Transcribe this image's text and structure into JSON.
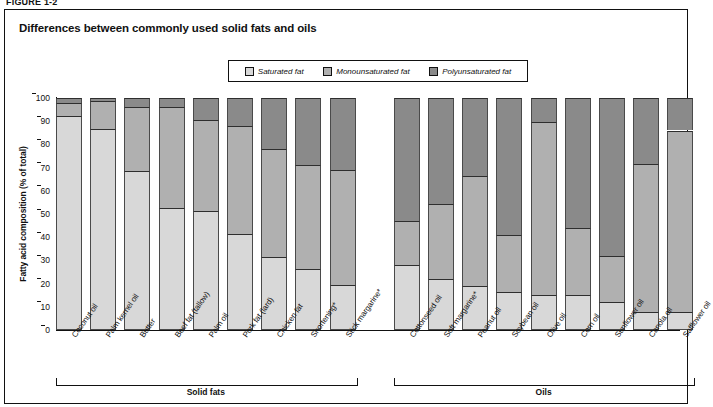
{
  "figure_number": "FIGURE 1-2",
  "chart_title": "Differences between commonly used solid fats and oils",
  "legend": {
    "items": [
      {
        "label": "Saturated fat",
        "color": "#d8d8d8",
        "key": "saturated"
      },
      {
        "label": "Monounsaturated fat",
        "color": "#b0b0b0",
        "key": "monounsaturated"
      },
      {
        "label": "Polyunsaturated fat",
        "color": "#8a8a8a",
        "key": "polyunsaturated"
      }
    ]
  },
  "axes": {
    "ylabel": "Fatty acid composition (% of total)",
    "yticks": [
      "0",
      "10",
      "20",
      "30",
      "40",
      "50",
      "60",
      "70",
      "80",
      "90",
      "100"
    ],
    "ymin": 0,
    "ymax": 100
  },
  "groups": [
    {
      "label": "Solid fats",
      "count": 9
    },
    {
      "label": "Oils",
      "count": 9
    }
  ],
  "chart_data": {
    "type": "bar",
    "subtype": "stacked-100-percent",
    "title": "Differences between commonly used solid fats and oils",
    "xlabel": "",
    "ylabel": "Fatty acid composition (% of total)",
    "ylim": [
      0,
      100
    ],
    "ytick_step": 10,
    "grid": false,
    "legend_position": "top-center",
    "categories": [
      "Coconut oil",
      "Palm kernel oil",
      "Butter",
      "Beef fat (tallow)",
      "Palm oil",
      "Pork fat (lard)",
      "Chicken fat",
      "Shortening*",
      "Stick margarine*",
      "Cottonseed oil",
      "Soft margarine*",
      "Peanut oil",
      "Soybean oil",
      "Olive oil",
      "Corn oil",
      "Sunflower oil",
      "Canola oil",
      "Safflower oil"
    ],
    "groups": [
      "Solid fats",
      "Oils"
    ],
    "series": [
      {
        "name": "Saturated fat",
        "color": "#d8d8d8",
        "values": [
          92,
          86,
          68,
          52,
          51,
          41,
          31,
          26,
          19,
          27.5,
          21.5,
          18.5,
          16,
          14.5,
          14.5,
          11.5,
          7.5,
          7.5
        ]
      },
      {
        "name": "Monounsaturated fat",
        "color": "#b0b0b0",
        "values": [
          6,
          12.5,
          28,
          44,
          39.5,
          47,
          47,
          45,
          50,
          19.5,
          33,
          48,
          25,
          75,
          29.5,
          20.5,
          64,
          78.5
        ]
      },
      {
        "name": "Polyunsaturated fat",
        "color": "#8a8a8a",
        "values": [
          2,
          1.5,
          4,
          4,
          9.5,
          12,
          22,
          29,
          31,
          53,
          45.5,
          33.5,
          59,
          10.5,
          56,
          68,
          28.5,
          14
        ]
      }
    ],
    "cumulative_tops": {
      "saturated": [
        92,
        86,
        68,
        52,
        51,
        41,
        31,
        26,
        19,
        27.5,
        21.5,
        18.5,
        16,
        14.5,
        14.5,
        11.5,
        7.5,
        7.5
      ],
      "monounsaturated": [
        98,
        98.5,
        96,
        96,
        90.5,
        88,
        78,
        71,
        69,
        47,
        54.5,
        66.5,
        41,
        89.5,
        44,
        32,
        71.5,
        86
      ],
      "polyunsaturated": [
        100,
        100,
        100,
        100,
        100,
        100,
        100,
        100,
        100,
        100,
        100,
        100,
        100,
        100,
        100,
        100,
        100,
        100
      ]
    }
  }
}
